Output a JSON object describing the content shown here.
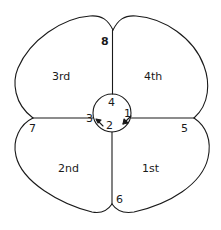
{
  "diagram": {
    "colors": {
      "stroke": "#1a1a1a",
      "background": "#ffffff"
    },
    "quadrants": [
      {
        "id": "q3",
        "label": "3rd"
      },
      {
        "id": "q4",
        "label": "4th"
      },
      {
        "id": "q2",
        "label": "2nd"
      },
      {
        "id": "q1",
        "label": "1st"
      }
    ],
    "center_circle": {
      "numbers": [
        "1",
        "2",
        "3",
        "4"
      ],
      "arrows": [
        "arrow-1-to-2",
        "arrow-2-to-3"
      ]
    },
    "junctions": [
      {
        "id": "top",
        "label": "8"
      },
      {
        "id": "right",
        "label": "5"
      },
      {
        "id": "bottom",
        "label": "6"
      },
      {
        "id": "left",
        "label": "7"
      }
    ]
  }
}
